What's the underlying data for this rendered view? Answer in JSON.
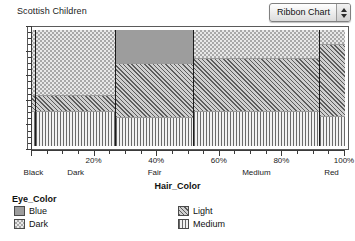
{
  "header": {
    "title": "Scottish Children",
    "chart_type_selected": "Ribbon Chart",
    "stepper_up_icon": "triangle-up-icon",
    "stepper_down_icon": "triangle-down-icon"
  },
  "axis": {
    "x_title": "Hair_Color",
    "percent_ticks": [
      "20%",
      "40%",
      "60%",
      "80%",
      "100%"
    ],
    "category_labels": [
      "Black",
      "Dark",
      "Fair",
      "Medium",
      "Red"
    ]
  },
  "legend": {
    "title": "Eye_Color",
    "items": [
      {
        "label": "Blue",
        "pattern": "solid-gray",
        "color": "#9d9d9d"
      },
      {
        "label": "Dark",
        "pattern": "checkerboard",
        "color": "#a8a8a8"
      },
      {
        "label": "Light",
        "pattern": "diagonal-hatch",
        "color": "#5d5d5d"
      },
      {
        "label": "Medium",
        "pattern": "vertical-lines",
        "color": "#6a6a6a"
      }
    ]
  },
  "chart_data": {
    "type": "bar",
    "variant": "mosaic-ribbon",
    "title": "Scottish Children",
    "xlabel": "Hair_Color",
    "ylabel": "",
    "xlim": [
      0,
      100
    ],
    "ylim": [
      0,
      100
    ],
    "grid": false,
    "legend_position": "bottom",
    "x_tick_values": [
      20,
      40,
      60,
      80,
      100
    ],
    "x_tick_labels": [
      "20%",
      "40%",
      "60%",
      "80%",
      "100%"
    ],
    "categories": [
      "Black",
      "Dark",
      "Fair",
      "Medium",
      "Red"
    ],
    "category_widths_pct": [
      1.5,
      25.5,
      25.0,
      40.0,
      8.0
    ],
    "series": [
      {
        "name": "Dark",
        "pattern": "checkerboard",
        "values": [
          57,
          57,
          29,
          25,
          13
        ]
      },
      {
        "name": "Blue",
        "pattern": "solid-gray",
        "values": [
          0,
          0,
          0,
          0,
          0
        ]
      },
      {
        "name": "Light",
        "pattern": "diagonal-hatch",
        "values": [
          14,
          14,
          47,
          46,
          62
        ]
      },
      {
        "name": "Medium",
        "pattern": "vertical-lines",
        "values": [
          29,
          29,
          24,
          29,
          25
        ]
      }
    ],
    "stack_order_top_to_bottom": [
      "Dark",
      "Light",
      "Medium"
    ]
  },
  "columns": [
    {
      "name": "Black",
      "width_pct": 1.5,
      "cells": [
        {
          "series": "Dark",
          "height_pct": 57
        },
        {
          "series": "Light",
          "height_pct": 14
        },
        {
          "series": "Medium",
          "height_pct": 29
        }
      ]
    },
    {
      "name": "Dark",
      "width_pct": 25.5,
      "cells": [
        {
          "series": "Dark",
          "height_pct": 57
        },
        {
          "series": "Light",
          "height_pct": 14
        },
        {
          "series": "Medium",
          "height_pct": 29
        }
      ]
    },
    {
      "name": "Fair",
      "width_pct": 25.0,
      "cells": [
        {
          "series": "Blue",
          "height_pct": 29
        },
        {
          "series": "Light",
          "height_pct": 47
        },
        {
          "series": "Medium",
          "height_pct": 24
        }
      ]
    },
    {
      "name": "Medium",
      "width_pct": 40.0,
      "cells": [
        {
          "series": "Dark",
          "height_pct": 25
        },
        {
          "series": "Light",
          "height_pct": 46
        },
        {
          "series": "Medium",
          "height_pct": 29
        }
      ]
    },
    {
      "name": "Red",
      "width_pct": 8.0,
      "cells": [
        {
          "series": "Dark",
          "height_pct": 13
        },
        {
          "series": "Light",
          "height_pct": 62
        },
        {
          "series": "Medium",
          "height_pct": 25
        }
      ]
    }
  ]
}
